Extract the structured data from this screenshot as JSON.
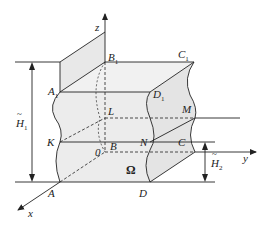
{
  "diagram": {
    "type": "3d-domain-sketch",
    "axes": {
      "x": "x",
      "y": "y",
      "z": "z",
      "origin": "0"
    },
    "points": {
      "A": "A",
      "B": "B",
      "C": "C",
      "D": "D",
      "A1": "A",
      "B1": "B",
      "C1": "C",
      "D1": "D",
      "K": "K",
      "L": "L",
      "M": "M",
      "N": "N"
    },
    "subscript": "1",
    "region_label": "Ω",
    "dimensions": {
      "H1_main": "H",
      "H1_sub": "1",
      "H2_main": "H",
      "H2_sub": "2"
    },
    "colors": {
      "stroke": "#222222",
      "fill": "#e6e6e6",
      "fill_light": "#efefef"
    }
  }
}
